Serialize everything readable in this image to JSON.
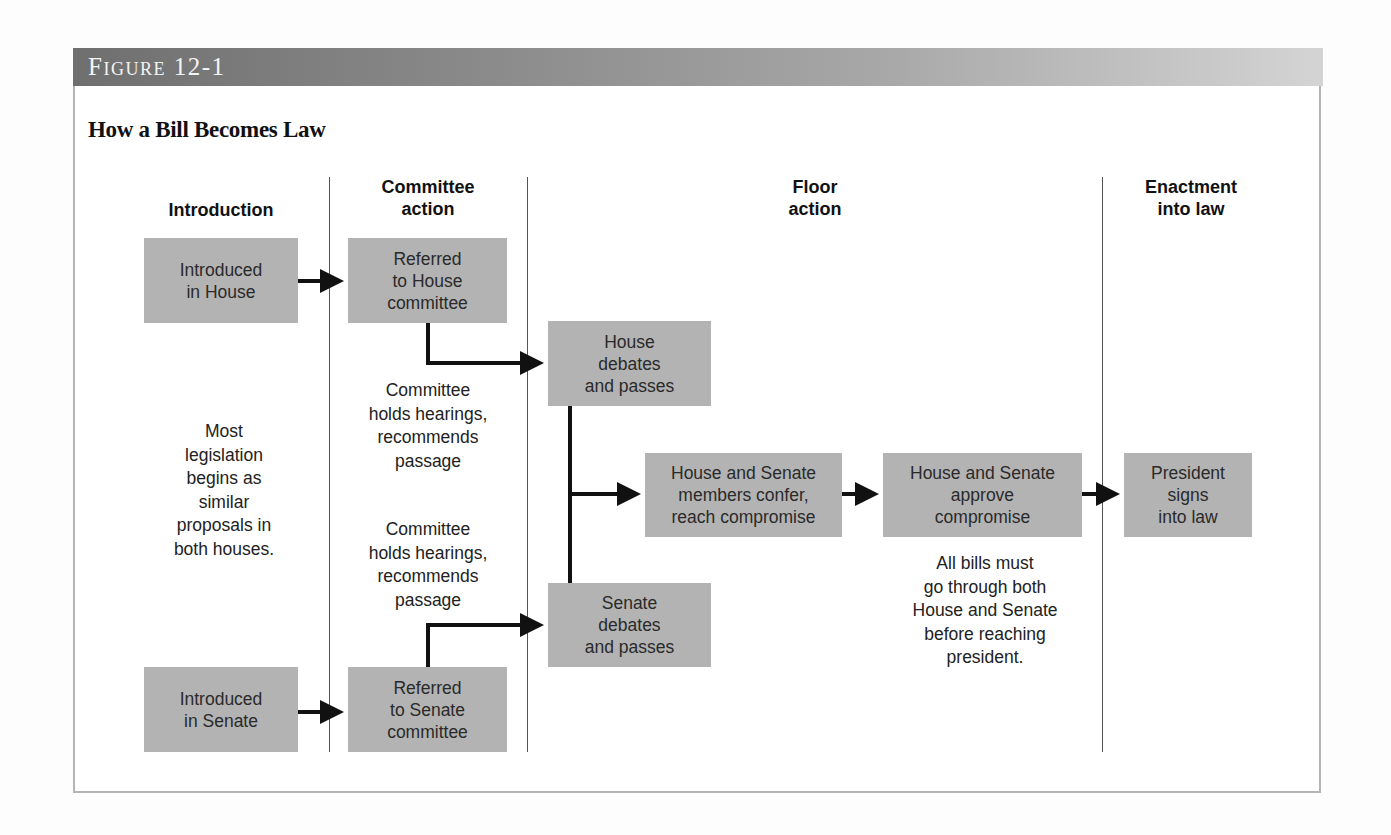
{
  "figure": {
    "label": "Figure 12-1",
    "title": "How a Bill Becomes Law",
    "band_gradient": [
      "#6f6f6f",
      "#d4d4d4"
    ],
    "box_color": "#b3b3b3",
    "line_color": "#111111"
  },
  "columns": [
    {
      "id": "introduction",
      "heading": "Introduction"
    },
    {
      "id": "committee",
      "heading": "Committee\naction"
    },
    {
      "id": "floor",
      "heading": "Floor\naction"
    },
    {
      "id": "enactment",
      "heading": "Enactment\ninto law"
    }
  ],
  "boxes": {
    "introduced_house": "Introduced\nin House",
    "referred_house": "Referred\nto House\ncommittee",
    "house_debates": "House\ndebates\nand passes",
    "confer": "House and Senate\nmembers confer,\nreach compromise",
    "approve": "House and Senate\napprove\ncompromise",
    "president": "President\nsigns\ninto law",
    "senate_debates": "Senate\ndebates\nand passes",
    "introduced_senate": "Introduced\nin Senate",
    "referred_senate": "Referred\nto Senate\ncommittee"
  },
  "notes": {
    "most_legislation": "Most\nlegislation\nbegins as\nsimilar\nproposals in\nboth houses.",
    "committee_house": "Committee\nholds hearings,\nrecommends\npassage",
    "committee_senate": "Committee\nholds hearings,\nrecommends\npassage",
    "all_bills": "All bills must\ngo through both\nHouse and Senate\nbefore reaching\npresident."
  },
  "flow": [
    {
      "from": "introduced_house",
      "to": "referred_house"
    },
    {
      "from": "referred_house",
      "to": "house_debates"
    },
    {
      "from": "introduced_senate",
      "to": "referred_senate"
    },
    {
      "from": "referred_senate",
      "to": "senate_debates"
    },
    {
      "from": "house_debates",
      "to": "confer"
    },
    {
      "from": "senate_debates",
      "to": "confer"
    },
    {
      "from": "confer",
      "to": "approve"
    },
    {
      "from": "approve",
      "to": "president"
    }
  ]
}
